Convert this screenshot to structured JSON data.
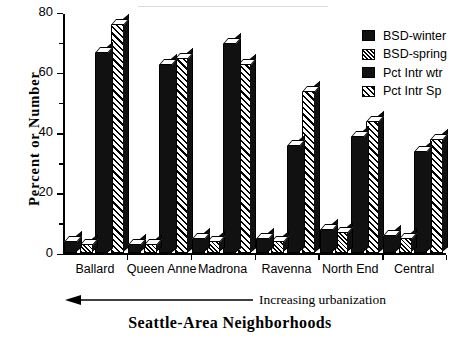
{
  "chart_data": {
    "type": "bar",
    "title": "",
    "xlabel": "Seattle-Area  Neighborhoods",
    "ylabel": "Percent  or  Number",
    "ylim": [
      0,
      80
    ],
    "yticks": [
      0,
      20,
      40,
      60,
      80
    ],
    "ytick_labels": [
      "0",
      "20",
      "40",
      "60",
      "80"
    ],
    "minor_yticks": [
      10,
      30,
      50,
      70
    ],
    "grid": false,
    "legend_position": "top-right",
    "annotation": "Increasing urbanization",
    "annotation_arrow_direction": "left",
    "categories": [
      "Ballard",
      "Queen Anne",
      "Madrona",
      "Ravenna",
      "North End",
      "Central"
    ],
    "series": [
      {
        "name": "BSD-winter",
        "pattern": "solid",
        "values": [
          4,
          3,
          5,
          5,
          8,
          6
        ]
      },
      {
        "name": "BSD-spring",
        "pattern": "hatch-fine",
        "values": [
          3,
          3,
          4,
          4,
          7,
          5
        ]
      },
      {
        "name": "Pct Intr wtr",
        "pattern": "solid",
        "values": [
          67,
          63,
          70,
          36,
          39,
          34
        ]
      },
      {
        "name": "Pct Intr Sp",
        "pattern": "hatch-coarse",
        "values": [
          76,
          65,
          63,
          54,
          44,
          38
        ]
      }
    ]
  },
  "legend": {
    "items": [
      {
        "label": "BSD-winter",
        "pattern": "solid"
      },
      {
        "label": "BSD-spring",
        "pattern": "hatch-fine"
      },
      {
        "label": "Pct Intr wtr",
        "pattern": "solid"
      },
      {
        "label": "Pct Intr Sp",
        "pattern": "hatch-coarse"
      }
    ]
  },
  "axes": {
    "y_title": "Percent  or  Number",
    "x_title": "Seattle-Area  Neighborhoods",
    "urbanization_note": "Increasing urbanization"
  }
}
